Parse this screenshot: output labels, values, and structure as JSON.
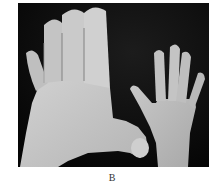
{
  "figure": {
    "panel_label": "B",
    "photo_description": "Grayscale clinical photograph of an enlarged hand (macrodactyly) beside a normal-sized hand on a dark background",
    "colors": {
      "background": "#0b0b0b",
      "skin_large": "#c6c6c6",
      "skin_small": "#bdbdbd",
      "shadow": "#8e8e8e"
    }
  }
}
